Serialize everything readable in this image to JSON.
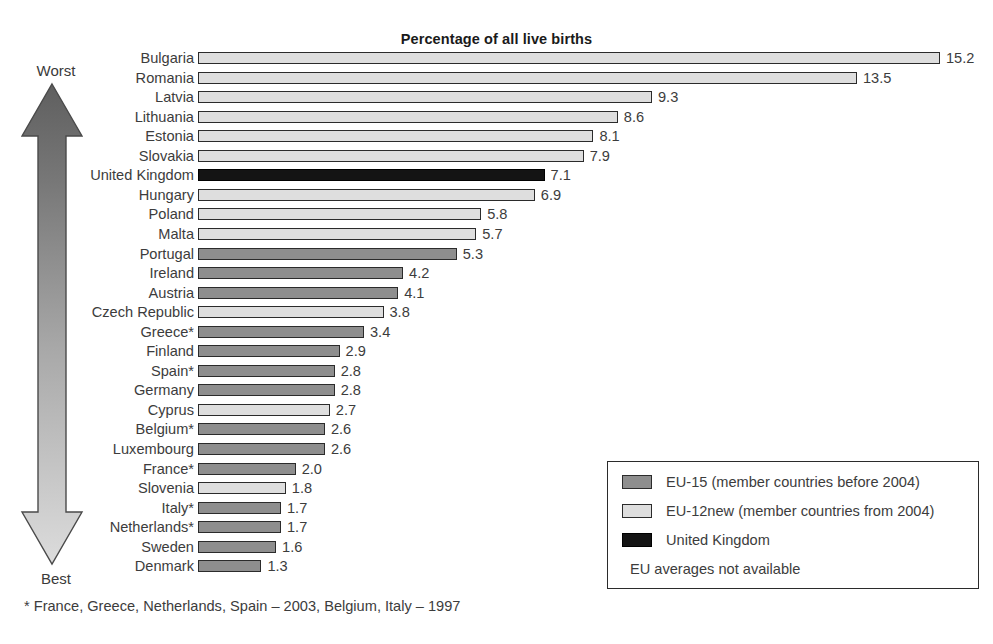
{
  "chart_data": {
    "type": "bar",
    "orientation": "horizontal",
    "title": "Percentage of all live births",
    "xlabel": "",
    "ylabel": "",
    "xlim": [
      0,
      15.2
    ],
    "grid": false,
    "categories": [
      "Bulgaria",
      "Romania",
      "Latvia",
      "Lithuania",
      "Estonia",
      "Slovakia",
      "United Kingdom",
      "Hungary",
      "Poland",
      "Malta",
      "Portugal",
      "Ireland",
      "Austria",
      "Czech Republic",
      "Greece*",
      "Finland",
      "Spain*",
      "Germany",
      "Cyprus",
      "Belgium*",
      "Luxembourg",
      "France*",
      "Slovenia",
      "Italy*",
      "Netherlands*",
      "Sweden",
      "Denmark"
    ],
    "values": [
      15.2,
      13.5,
      9.3,
      8.6,
      8.1,
      7.9,
      7.1,
      6.9,
      5.8,
      5.7,
      5.3,
      4.2,
      4.1,
      3.8,
      3.4,
      2.9,
      2.8,
      2.8,
      2.7,
      2.6,
      2.6,
      2.0,
      1.8,
      1.7,
      1.7,
      1.6,
      1.3
    ],
    "groups": [
      "eu12new",
      "eu12new",
      "eu12new",
      "eu12new",
      "eu12new",
      "eu12new",
      "uk",
      "eu12new",
      "eu12new",
      "eu12new",
      "eu15",
      "eu15",
      "eu15",
      "eu12new",
      "eu15",
      "eu15",
      "eu15",
      "eu15",
      "eu12new",
      "eu15",
      "eu15",
      "eu15",
      "eu12new",
      "eu15",
      "eu15",
      "eu15",
      "eu15"
    ],
    "value_labels": [
      "15.2",
      "13.5",
      "9.3",
      "8.6",
      "8.1",
      "7.9",
      "7.1",
      "6.9",
      "5.8",
      "5.7",
      "5.3",
      "4.2",
      "4.1",
      "3.8",
      "3.4",
      "2.9",
      "2.8",
      "2.8",
      "2.7",
      "2.6",
      "2.6",
      "2.0",
      "1.8",
      "1.7",
      "1.7",
      "1.6",
      "1.3"
    ],
    "legend": {
      "position": "bottom-right",
      "entries": [
        {
          "key": "eu15",
          "label": "EU-15 (member countries before 2004)",
          "color": "#8e8e8e"
        },
        {
          "key": "eu12new",
          "label": "EU-12new (member countries from 2004)",
          "color": "#dedede"
        },
        {
          "key": "uk",
          "label": "United Kingdom",
          "color": "#141414"
        }
      ],
      "note": "EU averages not available"
    },
    "annotations": {
      "axis_arrow_top": "Worst",
      "axis_arrow_bottom": "Best",
      "footnote": "* France, Greece, Netherlands, Spain – 2003, Belgium, Italy – 1997"
    }
  },
  "colors": {
    "eu15": "#8e8e8e",
    "eu12new": "#dedede",
    "uk": "#141414",
    "outline": "#2b2b2b",
    "text": "#3c3c3c",
    "arrow_top": "#6e6e6e",
    "arrow_bottom": "#d2d2d2"
  }
}
